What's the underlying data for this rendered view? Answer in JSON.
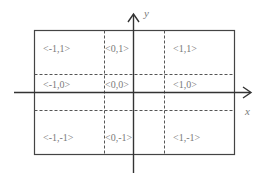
{
  "diagram": {
    "axes": {
      "x_label": "x",
      "y_label": "y"
    },
    "colors": {
      "axis": "#333333",
      "box": "#444444",
      "dashed": "#555555",
      "label": "#7a7a7a"
    },
    "grid": {
      "rows": 3,
      "cols": 3,
      "cells": [
        {
          "row": 0,
          "col": 0,
          "label": "<-1,1>"
        },
        {
          "row": 0,
          "col": 1,
          "label": "<0,1>"
        },
        {
          "row": 0,
          "col": 2,
          "label": "<1,1>"
        },
        {
          "row": 1,
          "col": 0,
          "label": "<-1,0>"
        },
        {
          "row": 1,
          "col": 1,
          "label": "<0,0>"
        },
        {
          "row": 1,
          "col": 2,
          "label": "<1,0>"
        },
        {
          "row": 2,
          "col": 0,
          "label": "<-1,-1>"
        },
        {
          "row": 2,
          "col": 1,
          "label": "<0,-1>"
        },
        {
          "row": 2,
          "col": 2,
          "label": "<1,-1>"
        }
      ]
    }
  }
}
